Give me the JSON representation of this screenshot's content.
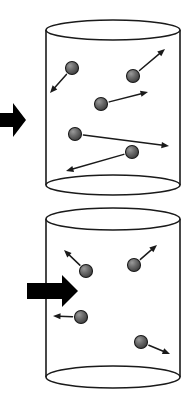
{
  "figure": {
    "background_color": "#ffffff",
    "outline_color": "#1a1a1a",
    "particle_fill": "#6e6e6e",
    "particle_edge": "#1a1a1a",
    "arrow_color": "#1a1a1a",
    "block_arrow_color": "#000000",
    "width": 190,
    "height": 406
  },
  "panels": [
    {
      "name": "top-panel",
      "label": "Top cylinder — larger volume, particles with long velocity vectors",
      "cylinder": {
        "name": "top-cylinder",
        "cx": 113,
        "rx": 67,
        "ry": 10,
        "top_y": 30,
        "bottom_y": 185,
        "left_x": 46,
        "right_x": 180
      },
      "block_arrow": {
        "name": "top-block-arrow",
        "direction": "right",
        "x_start": -6,
        "x_end": 26,
        "y_center": 120,
        "shaft_half_height": 7,
        "head_half_height": 17,
        "head_length": 13
      },
      "particles": [
        {
          "id": "t1",
          "cx": 72,
          "cy": 68,
          "r": 6.5,
          "vector": {
            "to_x": 50,
            "to_y": 93
          }
        },
        {
          "id": "t2",
          "cx": 133,
          "cy": 76,
          "r": 6.5,
          "vector": {
            "to_x": 165,
            "to_y": 49
          }
        },
        {
          "id": "t3",
          "cx": 101,
          "cy": 104,
          "r": 6.5,
          "vector": {
            "to_x": 148,
            "to_y": 92
          }
        },
        {
          "id": "t4",
          "cx": 75,
          "cy": 134,
          "r": 6.5,
          "vector": {
            "to_x": 169,
            "to_y": 146
          }
        },
        {
          "id": "t5",
          "cx": 132,
          "cy": 152,
          "r": 6.5,
          "vector": {
            "to_x": 66,
            "to_y": 171
          }
        }
      ]
    },
    {
      "name": "bottom-panel",
      "label": "Bottom cylinder — compressed by force, particles with short velocity vectors",
      "cylinder": {
        "name": "bottom-cylinder",
        "cx": 113,
        "rx": 67,
        "ry": 11,
        "top_y": 219,
        "bottom_y": 377,
        "left_x": 46,
        "right_x": 180
      },
      "block_arrow": {
        "name": "bottom-block-arrow",
        "direction": "right",
        "x_start": 27,
        "x_end": 78,
        "y_center": 291,
        "shaft_half_height": 8,
        "head_half_height": 16,
        "head_length": 16
      },
      "particles": [
        {
          "id": "b1",
          "cx": 86,
          "cy": 271,
          "r": 6.5,
          "vector": {
            "to_x": 64,
            "to_y": 250
          }
        },
        {
          "id": "b2",
          "cx": 134,
          "cy": 265,
          "r": 6.5,
          "vector": {
            "to_x": 157,
            "to_y": 245
          }
        },
        {
          "id": "b3",
          "cx": 81,
          "cy": 317,
          "r": 6.5,
          "vector": {
            "to_x": 53,
            "to_y": 316
          }
        },
        {
          "id": "b4",
          "cx": 141,
          "cy": 342,
          "r": 6.5,
          "vector": {
            "to_x": 170,
            "to_y": 354
          }
        }
      ]
    }
  ]
}
